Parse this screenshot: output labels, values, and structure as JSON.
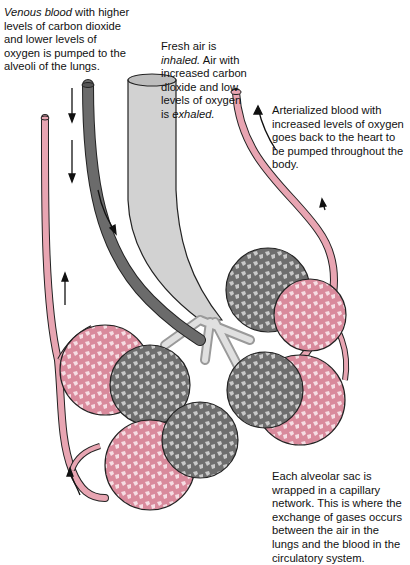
{
  "labels": {
    "venous": {
      "em": "Venous blood",
      "rest": " with higher levels of carbon dioxide and lower levels of oxygen is pumped to the alveoli of the lungs."
    },
    "fresh_air": {
      "p1": "Fresh air is ",
      "em1": "inhaled.",
      "p2": " Air with increased carbon dioxide and low levels of oxygen is ",
      "em2": "exhaled."
    },
    "arterialized": {
      "text": "Arterialized blood with increased levels of oxygen goes back to the heart to be pumped throughout the body."
    },
    "alveolar_sac": {
      "text": "Each alveolar sac is wrapped in a capillary network. This is where the exchange of gases occurs between the air in the lungs and the blood in the circulatory system."
    }
  },
  "colors": {
    "venous_vessel": "#6b6b6b",
    "arterial_vessel": "#e8a5b2",
    "airway": "#d4d4d4",
    "alveoli_gray": "#757575",
    "alveoli_pink": "#e6a6b4",
    "outline": "#222222"
  }
}
